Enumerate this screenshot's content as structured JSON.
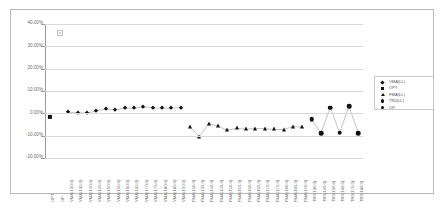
{
  "chart_data": {
    "type": "scatter",
    "title": "",
    "xlabel": "",
    "ylabel": "",
    "ylim": [
      -20,
      40
    ],
    "yticks": [
      40,
      30,
      20,
      10,
      0,
      -10,
      -20
    ],
    "ytick_labels": [
      "40.00%",
      "30.00%",
      "20.00%",
      "10.00%",
      "0.00%",
      "-10.00%",
      "-20.00%"
    ],
    "grid": true,
    "legend_position": "right",
    "marker_color": "#111111",
    "categories": [
      "OPT",
      "OP",
      "VMA(130.0)",
      "VMA(135.0)",
      "VMA(140.0)",
      "VMA(145.0)",
      "VMA(150.0)",
      "VMA(155.0)",
      "VMA(160.0)",
      "VMA(165.0)",
      "VMA(170.0)",
      "VMA(175.0)",
      "VMA(180.0)",
      "VMA(185.0)",
      "VMA(190.0)",
      "FMA(130.0)",
      "FMA(135.0)",
      "FMA(140.0)",
      "FMA(145.0)",
      "FMA(150.0)",
      "FMA(155.0)",
      "FMA(160.0)",
      "FMA(165.0)",
      "FMA(170.0)",
      "FMA(175.0)",
      "FMA(180.0)",
      "FMA(185.0)",
      "FMA(190.0)",
      "TR0(130.0)",
      "TR0(140.0)",
      "TR0(150.0)",
      "TR0(160.0)",
      "TR0(170.0)",
      "TR0(180.0)"
    ],
    "series": [
      {
        "name": "VMA(LL)",
        "marker": "diamond",
        "points": [
          {
            "i": 2,
            "x": "VMA(130.0)",
            "y": 0.4
          },
          {
            "i": 3,
            "x": "VMA(135.0)",
            "y": 0.2
          },
          {
            "i": 4,
            "x": "VMA(140.0)",
            "y": 0.1
          },
          {
            "i": 5,
            "x": "VMA(145.0)",
            "y": 1.1
          },
          {
            "i": 6,
            "x": "VMA(150.0)",
            "y": 1.9
          },
          {
            "i": 7,
            "x": "VMA(155.0)",
            "y": 1.6
          },
          {
            "i": 8,
            "x": "VMA(160.0)",
            "y": 2.2
          },
          {
            "i": 9,
            "x": "VMA(165.0)",
            "y": 2.3
          },
          {
            "i": 10,
            "x": "VMA(170.0)",
            "y": 2.9
          },
          {
            "i": 11,
            "x": "VMA(175.0)",
            "y": 2.4
          },
          {
            "i": 12,
            "x": "VMA(180.0)",
            "y": 2.3
          },
          {
            "i": 13,
            "x": "VMA(185.0)",
            "y": 2.3
          },
          {
            "i": 14,
            "x": "VMA(190.0)",
            "y": 2.6
          }
        ]
      },
      {
        "name": "OPT",
        "marker": "square",
        "points": [
          {
            "i": 0,
            "x": "OPT",
            "y": -1.6
          }
        ]
      },
      {
        "name": "FMA(LL)",
        "marker": "triangle",
        "points": [
          {
            "i": 15,
            "x": "FMA(130.0)",
            "y": -6.3
          },
          {
            "i": 16,
            "x": "FMA(135.0)",
            "y": -10.4
          },
          {
            "i": 17,
            "x": "FMA(140.0)",
            "y": -4.6
          },
          {
            "i": 18,
            "x": "FMA(145.0)",
            "y": -5.8
          },
          {
            "i": 19,
            "x": "FMA(150.0)",
            "y": -7.5
          },
          {
            "i": 20,
            "x": "FMA(155.0)",
            "y": -6.7
          },
          {
            "i": 21,
            "x": "FMA(160.0)",
            "y": -7.1
          },
          {
            "i": 22,
            "x": "FMA(165.0)",
            "y": -6.8
          },
          {
            "i": 23,
            "x": "FMA(170.0)",
            "y": -6.9
          },
          {
            "i": 24,
            "x": "FMA(175.0)",
            "y": -7.2
          },
          {
            "i": 25,
            "x": "FMA(180.0)",
            "y": -7.3
          },
          {
            "i": 26,
            "x": "FMA(185.0)",
            "y": -5.9
          },
          {
            "i": 27,
            "x": "FMA(190.0)",
            "y": -6.2
          }
        ]
      },
      {
        "name": "TR0(LL)",
        "marker": "circle",
        "points": [
          {
            "i": 28,
            "x": "TR0(130.0)",
            "y": -2.6
          },
          {
            "i": 29,
            "x": "TR0(140.0)",
            "y": -8.9
          },
          {
            "i": 30,
            "x": "TR0(150.0)",
            "y": 2.6
          },
          {
            "i": 31,
            "x": "TR0(160.0)",
            "y": -8.7
          },
          {
            "i": 32,
            "x": "TR0(170.0)",
            "y": 3.1
          },
          {
            "i": 33,
            "x": "TR0(180.0)",
            "y": -8.8
          }
        ]
      },
      {
        "name": "OP",
        "marker": "circle",
        "points": []
      }
    ]
  },
  "legend": {
    "entries": [
      {
        "label": "VMA(LL)",
        "marker": "diamond"
      },
      {
        "label": "OPT",
        "marker": "square"
      },
      {
        "label": "FMA(LL)",
        "marker": "triangle"
      },
      {
        "label": "TR0(LL)",
        "marker": "circle"
      },
      {
        "label": "OP",
        "marker": "circle"
      }
    ]
  },
  "annotations": {
    "top_left_marker": "x"
  }
}
